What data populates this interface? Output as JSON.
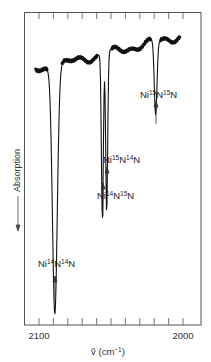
{
  "chart_data": {
    "type": "line",
    "title": "",
    "xlabel": "ṽ (cm⁻¹)",
    "ylabel": "Absorption",
    "ylabel_arrow": "down",
    "x_reversed": true,
    "xlim": [
      2110,
      1988
    ],
    "x_ticks_major": [
      2100,
      2000
    ],
    "x_tick_labels": [
      "2100",
      "2000"
    ],
    "x_tick_spacing": 10,
    "grid": false,
    "peaks": [
      {
        "label": "Ni¹⁴N¹⁴N",
        "label_parts": [
          "Ni",
          "14",
          "N",
          "14",
          "N"
        ],
        "wavenumber": 2089,
        "relative_depth": 0.92
      },
      {
        "label": "Ni¹⁴N¹⁵N",
        "label_parts": [
          "Ni",
          "14",
          "N",
          "15",
          "N"
        ],
        "wavenumber": 2056,
        "relative_depth": 0.62
      },
      {
        "label": "Ni¹⁵N¹⁴N",
        "label_parts": [
          "Ni",
          "15",
          "N",
          "14",
          "N"
        ],
        "wavenumber": 2053,
        "relative_depth": 0.6
      },
      {
        "label": "Ni¹⁵N¹⁵N",
        "label_parts": [
          "Ni",
          "15",
          "N",
          "15",
          "N"
        ],
        "wavenumber": 2019,
        "relative_depth": 0.28
      }
    ],
    "baseline_trend": "rising from left (low) to right (high), noisy"
  },
  "labels": {
    "peak1": {
      "a": "Ni",
      "s1": "14",
      "b": "N",
      "s2": "14",
      "c": "N"
    },
    "peak2": {
      "a": "Ni",
      "s1": "14",
      "b": "N",
      "s2": "15",
      "c": "N"
    },
    "peak3": {
      "a": "Ni",
      "s1": "15",
      "b": "N",
      "s2": "14",
      "c": "N"
    },
    "peak4": {
      "a": "Ni",
      "s1": "15",
      "b": "N",
      "s2": "15",
      "c": "N"
    },
    "tick_2100": "2100",
    "tick_2000": "2000",
    "xlabel": "ṽ (cm⁻¹)",
    "ylabel": "Absorption"
  },
  "colors": {
    "ink": "#222222",
    "frame": "#555555"
  }
}
